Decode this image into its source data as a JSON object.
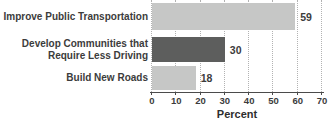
{
  "chart_data": {
    "type": "bar",
    "orientation": "horizontal",
    "categories": [
      "Improve Public Transportation",
      "Develop Communities that\nRequire Less Driving",
      "Build New Roads"
    ],
    "values": [
      59,
      30,
      18
    ],
    "value_labels": [
      "59",
      "30",
      "18"
    ],
    "bar_colors": [
      "#c6c7c6",
      "#5d5e5d",
      "#c6c7c6"
    ],
    "title": "",
    "xlabel": "Percent",
    "ylabel": "",
    "xlim": [
      0,
      70
    ],
    "xticks": [
      0,
      10,
      20,
      30,
      40,
      50,
      60,
      70
    ],
    "grid": "vertical-dotted",
    "legend": "none"
  },
  "palette": {
    "background": "#ffffff",
    "light_bar": "#c6c7c6",
    "dark_bar": "#5d5e5d",
    "text": "#3c3c3c",
    "axis": "#4b4b4b",
    "gridline": "#b2b2b2"
  }
}
